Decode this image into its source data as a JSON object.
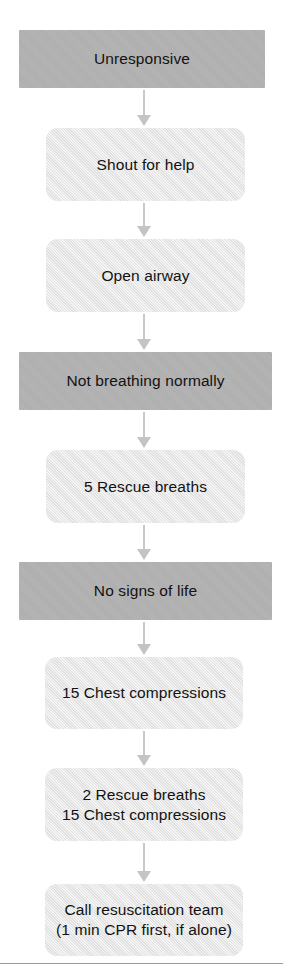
{
  "figure": {
    "colors": {
      "state_fill": "#b2b2b2",
      "action_fill": "#e7e7e7",
      "connector": "#c9c9c9",
      "text": "#121212",
      "rule": "#9a9a9a",
      "background": "#ffffff"
    }
  },
  "nodes": [
    {
      "id": "unresponsive",
      "label": "Unresponsive",
      "kind": "state",
      "x": 19,
      "y": 30,
      "w": 246,
      "h": 58
    },
    {
      "id": "shout-for-help",
      "label": "Shout for help",
      "kind": "action",
      "x": 46,
      "y": 128,
      "w": 199,
      "h": 73
    },
    {
      "id": "open-airway",
      "label": "Open airway",
      "kind": "action",
      "x": 46,
      "y": 239,
      "w": 199,
      "h": 73
    },
    {
      "id": "not-breathing-normally",
      "label": "Not breathing normally",
      "kind": "state",
      "x": 19,
      "y": 352,
      "w": 253,
      "h": 58
    },
    {
      "id": "five-rescue-breaths",
      "label": "5 Rescue breaths",
      "kind": "action",
      "x": 46,
      "y": 450,
      "w": 199,
      "h": 73
    },
    {
      "id": "no-signs-of-life",
      "label": "No signs of  life",
      "kind": "state",
      "x": 19,
      "y": 562,
      "w": 253,
      "h": 58
    },
    {
      "id": "fifteen-chest-compressions",
      "label": "15 Chest compressions",
      "kind": "action",
      "x": 45,
      "y": 657,
      "w": 198,
      "h": 72
    },
    {
      "id": "two-breaths-fifteen-compressions",
      "label": "2 Rescue breaths\n15 Chest compressions",
      "kind": "action",
      "x": 45,
      "y": 768,
      "w": 198,
      "h": 73
    },
    {
      "id": "call-resuscitation-team",
      "label": "Call resuscitation team\n(1 min CPR first, if  alone)",
      "kind": "action",
      "x": 45,
      "y": 884,
      "w": 198,
      "h": 72
    }
  ],
  "connectors": [
    {
      "id": "unresponsive-to-shout",
      "from": "unresponsive",
      "to": "shout-for-help",
      "x": 137,
      "y": 90,
      "h": 36
    },
    {
      "id": "shout-to-open-airway",
      "from": "shout-for-help",
      "to": "open-airway",
      "x": 137,
      "y": 203,
      "h": 34
    },
    {
      "id": "open-airway-to-not-breathing",
      "from": "open-airway",
      "to": "not-breathing-normally",
      "x": 137,
      "y": 314,
      "h": 36
    },
    {
      "id": "not-breathing-to-five-breaths",
      "from": "not-breathing-normally",
      "to": "five-rescue-breaths",
      "x": 137,
      "y": 412,
      "h": 36
    },
    {
      "id": "five-breaths-to-no-signs",
      "from": "five-rescue-breaths",
      "to": "no-signs-of-life",
      "x": 137,
      "y": 525,
      "h": 35
    },
    {
      "id": "no-signs-to-compressions",
      "from": "no-signs-of-life",
      "to": "fifteen-chest-compressions",
      "x": 137,
      "y": 622,
      "h": 33
    },
    {
      "id": "compressions-to-cycle",
      "from": "fifteen-chest-compressions",
      "to": "two-breaths-fifteen-compressions",
      "x": 137,
      "y": 731,
      "h": 35
    },
    {
      "id": "cycle-to-call-team",
      "from": "two-breaths-fifteen-compressions",
      "to": "call-resuscitation-team",
      "x": 137,
      "y": 843,
      "h": 39
    }
  ],
  "footer_rule": {
    "x": 0,
    "y": 963,
    "w": 283
  }
}
